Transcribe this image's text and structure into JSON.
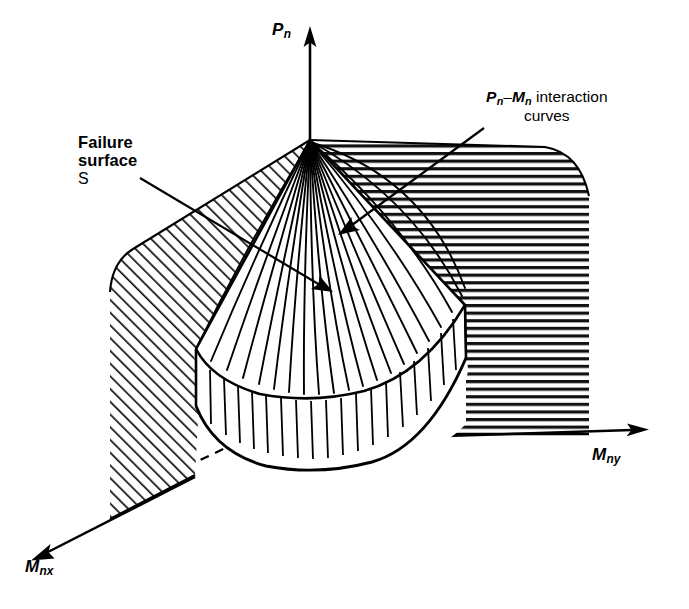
{
  "figure": {
    "kind": "engineering-line-drawing",
    "title_visible": false
  },
  "axes": {
    "vertical": {
      "name": "axial-load-axis",
      "label_main": "P",
      "label_sub": "n"
    },
    "right": {
      "name": "moment-y-axis",
      "label_main": "M",
      "label_sub": "ny"
    },
    "left": {
      "name": "moment-x-axis",
      "label_main": "M",
      "label_sub": "nx"
    }
  },
  "annotations": [
    {
      "name": "failure-surface-callout",
      "line1": "Failure",
      "line2": "surface",
      "line3": "S",
      "arrow": "points-down-right-to-cone-left-face"
    },
    {
      "name": "interaction-curves-callout",
      "line1_main_a": "P",
      "line1_sub_a": "n",
      "line1_dash": "–",
      "line1_main_b": "M",
      "line1_sub_b": "n",
      "line1_tail": " interaction",
      "line2": "curves",
      "arrow": "points-down-left-to-cone-right-face"
    }
  ],
  "colors": {
    "ink": "#000000",
    "background": "#ffffff",
    "hatch": "#1a1a1a"
  },
  "geometry": {
    "apex": [
      310,
      140
    ],
    "origin": [
      310,
      408
    ],
    "cone_meridian_count": 22,
    "base_skirt_rib_count": 17,
    "left_plane_hatch": "diagonal-45-down-right",
    "right_plane_hatch": "horizontal"
  }
}
